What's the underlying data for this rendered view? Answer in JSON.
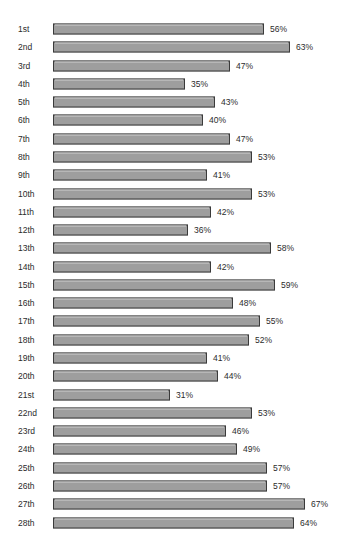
{
  "background_color": "#ffffff",
  "clipped_title_remnant": "",
  "chart_data": {
    "type": "bar",
    "orientation": "horizontal",
    "title": "",
    "subtitle": "",
    "xlabel": "",
    "ylabel": "",
    "grid": false,
    "legend": null,
    "value_suffix": "%",
    "xlim": [
      0,
      67
    ],
    "categories": [
      "1st",
      "2nd",
      "3rd",
      "4th",
      "5th",
      "6th",
      "7th",
      "8th",
      "9th",
      "10th",
      "11th",
      "12th",
      "13th",
      "14th",
      "15th",
      "16th",
      "17th",
      "18th",
      "19th",
      "20th",
      "21st",
      "22nd",
      "23rd",
      "24th",
      "25th",
      "26th",
      "27th",
      "28th"
    ],
    "values": [
      56,
      63,
      47,
      35,
      43,
      40,
      47,
      53,
      41,
      53,
      42,
      36,
      58,
      42,
      59,
      48,
      55,
      52,
      41,
      44,
      31,
      53,
      46,
      49,
      57,
      57,
      67,
      64
    ],
    "data_labels": [
      "56%",
      "63%",
      "47%",
      "35%",
      "43%",
      "40%",
      "47%",
      "53%",
      "41%",
      "53%",
      "42%",
      "36%",
      "58%",
      "42%",
      "59%",
      "48%",
      "55%",
      "52%",
      "41%",
      "44%",
      "31%",
      "53%",
      "46%",
      "49%",
      "57%",
      "57%",
      "67%",
      "64%"
    ],
    "bar_fill_color": "#9e9e9e",
    "bar_border_color": "#3a3a3a",
    "bar_highlight_color": "#cfcfcf",
    "text_color": "#2b2b2b"
  },
  "layout": {
    "bar_origin_x": 53,
    "px_per_percent": 3.76,
    "first_row_center_y": 29,
    "row_pitch": 18.28,
    "bar_height": 11,
    "value_label_gap": 6
  }
}
